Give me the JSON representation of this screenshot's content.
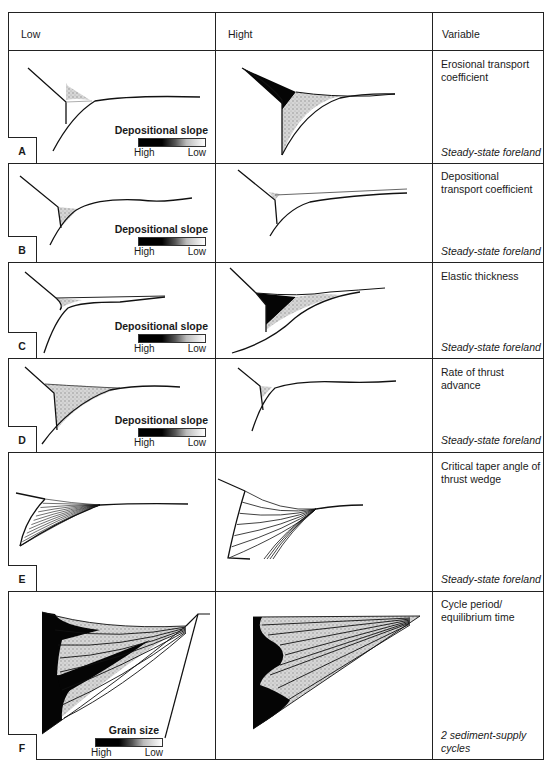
{
  "header": {
    "col_low": "Low",
    "col_high": "Hight",
    "col_variable": "Variable"
  },
  "legend": {
    "depositional_title": "Depositional slope",
    "grain_title": "Grain size",
    "high": "High",
    "low": "Low"
  },
  "rows": [
    {
      "letter": "A",
      "variable": "Erosional transport coefficient",
      "footnote": "Steady-state foreland",
      "legend": "depositional_slope"
    },
    {
      "letter": "B",
      "variable": "Depositional transport coefficient",
      "footnote": "Steady-state foreland",
      "legend": "depositional_slope"
    },
    {
      "letter": "C",
      "variable": "Elastic thickness",
      "footnote": "Steady-state foreland",
      "legend": "depositional_slope"
    },
    {
      "letter": "D",
      "variable": "Rate of thrust advance",
      "footnote": "Steady-state foreland",
      "legend": "depositional_slope"
    },
    {
      "letter": "E",
      "variable": "Critical taper angle of thrust wedge",
      "footnote": "Steady-state foreland",
      "legend": null
    },
    {
      "letter": "F",
      "variable": "Cycle period/ equilibrium time",
      "footnote": "2 sediment-supply cycles",
      "legend": "grain_size"
    }
  ],
  "colors": {
    "ink": "#1a1a1a",
    "stipple": "#c8c8c8",
    "dark_fill": "#050505"
  }
}
